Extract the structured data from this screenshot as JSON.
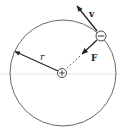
{
  "diagram": {
    "type": "bohr-atom-orbit",
    "colors": {
      "stroke": "#333333",
      "orbit": "#555555",
      "artifact_line": "#e6e6e6",
      "background": "#ffffff"
    },
    "orbit": {
      "cx": 63,
      "cy": 73,
      "r": 53
    },
    "nucleus": {
      "cx": 62,
      "cy": 73,
      "r": 4.5,
      "symbol": "+"
    },
    "electron": {
      "cx": 101,
      "cy": 36,
      "r": 5,
      "symbol": "−"
    },
    "labels": {
      "velocity": "v",
      "force": "F",
      "radius": "r"
    }
  }
}
